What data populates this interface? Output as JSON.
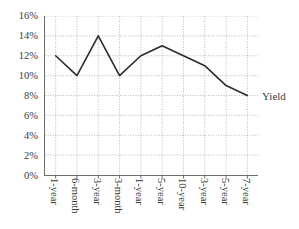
{
  "chart_data": {
    "type": "line",
    "title": "",
    "xlabel": "",
    "ylabel": "",
    "ylim": [
      0,
      16
    ],
    "ytick_labels": [
      "16%",
      "14%",
      "12%",
      "10%",
      "8%",
      "6%",
      "4%",
      "2%",
      "0%"
    ],
    "ytick_values": [
      16,
      14,
      12,
      10,
      8,
      6,
      4,
      2,
      0
    ],
    "grid": true,
    "grid_style": "dotted",
    "legend": "none",
    "categories": [
      "1-year",
      "6-month",
      "3-year",
      "3-month",
      "1-year",
      "5-year",
      "10-year",
      "3-year",
      "5-year",
      "7-year"
    ],
    "series": [
      {
        "name": "Yield",
        "values": [
          12,
          10,
          14,
          10,
          12,
          13,
          12,
          11,
          9,
          8
        ],
        "color": "#2b2b2b"
      }
    ],
    "annotations": [
      {
        "text": "Yield",
        "target": "series-end"
      }
    ]
  },
  "axes": {
    "line_color": "#6e6e6e",
    "grid_color": "#9a9a9a"
  }
}
